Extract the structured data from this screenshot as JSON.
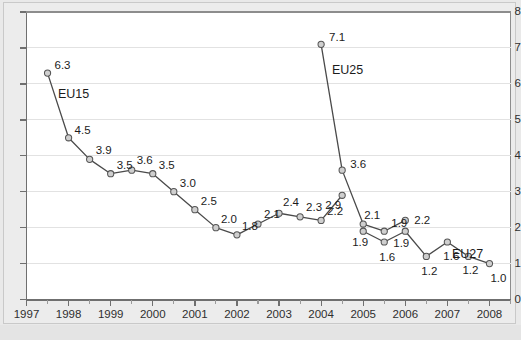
{
  "chart_data": {
    "type": "line",
    "title": "",
    "subtitle": "",
    "xlabel": "",
    "ylabel": "",
    "xlim": [
      1997,
      2008.5
    ],
    "ylim": [
      0,
      8
    ],
    "grid": true,
    "legend": "inline-annotations",
    "yticks": [
      "0",
      "1",
      "2",
      "3",
      "4",
      "5",
      "6",
      "7",
      "8"
    ],
    "xticks": [
      "1997",
      "1998",
      "1999",
      "2000",
      "2001",
      "2002",
      "2003",
      "2004",
      "2005",
      "2006",
      "2007",
      "2008"
    ],
    "series": [
      {
        "name": "EU15",
        "annotation": "EU15",
        "x": [
          1997.5,
          1998.0,
          1998.5,
          1999.0,
          1999.5,
          2000.0,
          2000.5,
          2001.0,
          2001.5,
          2002.0,
          2002.5,
          2003.0,
          2003.5,
          2004.0,
          2004.5
        ],
        "values": [
          6.3,
          4.5,
          3.9,
          3.5,
          3.6,
          3.5,
          3.0,
          2.5,
          2.0,
          1.8,
          2.1,
          2.4,
          2.3,
          2.2,
          2.9
        ],
        "labels": [
          "6.3",
          "4.5",
          "3.9",
          "3.5",
          "3.6",
          "3.5",
          "3.0",
          "2.5",
          "2.0",
          "1.8",
          "2.1",
          "2.4",
          "2.3",
          "2.2",
          "2.9"
        ]
      },
      {
        "name": "EU25",
        "annotation": "EU25",
        "x": [
          2004.0,
          2004.5,
          2005.0,
          2005.5,
          2006.0
        ],
        "values": [
          7.1,
          3.6,
          2.1,
          1.9,
          2.2
        ],
        "labels": [
          "7.1",
          "3.6",
          "2.1",
          "1.9",
          "2.2"
        ]
      },
      {
        "name": "EU27",
        "annotation": "EU27",
        "x": [
          2005.0,
          2005.5,
          2006.0,
          2006.5,
          2007.0,
          2007.5,
          2008.0
        ],
        "values": [
          1.9,
          1.6,
          1.9,
          1.2,
          1.6,
          1.2,
          1.0
        ],
        "labels": [
          "1.9",
          "1.6",
          "1.9",
          "1.2",
          "1.6",
          "1.2",
          "1.0"
        ]
      }
    ],
    "colors": {
      "line": "#4a4a4a",
      "marker_fill": "#cfcfcf",
      "marker_stroke": "#555555",
      "grid": "#e2e2e2",
      "axis": "#6f6f6f",
      "plot_background": "#ffffff",
      "figure_background": "#e9e9e9",
      "text": "#1c1c1c"
    }
  }
}
